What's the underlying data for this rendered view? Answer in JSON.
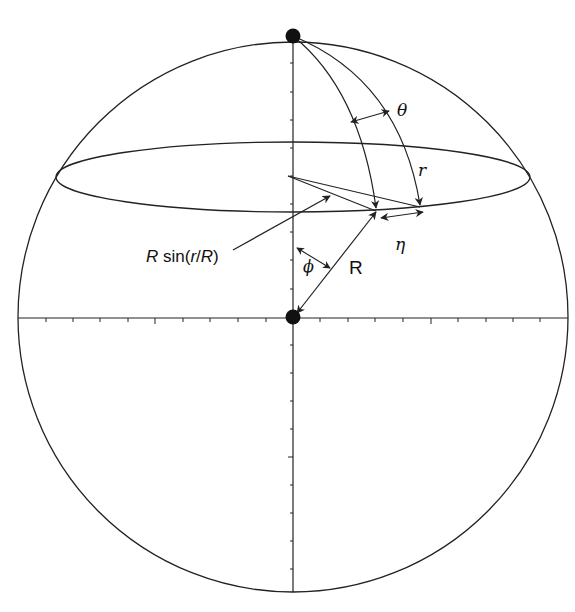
{
  "diagram": {
    "title": "",
    "colors": {
      "stroke": "#222222",
      "background": "#ffffff",
      "point": "#111111"
    },
    "labels": {
      "theta": "θ",
      "r": "r",
      "eta": "η",
      "R": "R",
      "phi": "ϕ",
      "r_sin_prefix": "R",
      "r_sin_func": " sin(",
      "r_sin_arg": "r",
      "r_sin_slash": "/",
      "r_sin_arg2": "R",
      "r_sin_close": ")"
    },
    "points": [
      {
        "name": "north-pole",
        "x": 293,
        "y": 36
      },
      {
        "name": "center",
        "x": 293,
        "y": 317
      }
    ],
    "sphere": {
      "cx": 293,
      "cy": 317,
      "r": 275
    },
    "latitude_ellipse": {
      "cx": 293,
      "cy": 177,
      "rx": 237,
      "ry": 35
    },
    "axis_ticks": {
      "horizontal_count": 10,
      "vertical_count": 9
    }
  }
}
